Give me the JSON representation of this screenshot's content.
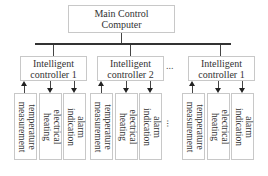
{
  "main": {
    "line1": "Main Control",
    "line2": "Computer"
  },
  "controllers": [
    {
      "line1": "Intelligent",
      "line2": "controller 1"
    },
    {
      "line1": "Intelligent",
      "line2": "controller 2"
    },
    {
      "line1": "Intelligent",
      "line2": "controller 1"
    }
  ],
  "modules": [
    {
      "line1": "temperature",
      "line2": "measurement",
      "direction": "up"
    },
    {
      "line1": "electrical",
      "line2": "heating",
      "direction": "down"
    },
    {
      "line1": "alarm",
      "line2": "indication",
      "direction": "down"
    }
  ],
  "ellipsis": "..."
}
